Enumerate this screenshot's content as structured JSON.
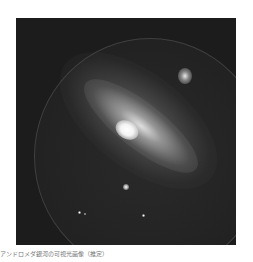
{
  "image": {
    "subject": "galaxy",
    "description": "Grayscale astronomical image of a spiral galaxy with bright core, inside a circular field on a dark square frame",
    "colors": {
      "background": "#ffffff",
      "frame": "#1c1c1c",
      "core": "#ffffff"
    },
    "features": [
      {
        "name": "galaxy-core",
        "x": 123,
        "y": 130
      },
      {
        "name": "companion-galaxy",
        "x": 185,
        "y": 75
      },
      {
        "name": "foreground-star",
        "x": 126,
        "y": 187
      }
    ]
  },
  "caption": {
    "text": "アンドロメダ銀河の可視光画像（推定）"
  }
}
